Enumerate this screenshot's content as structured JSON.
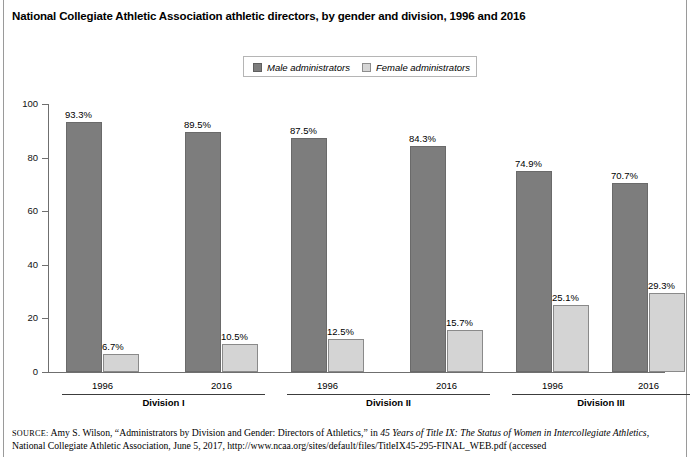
{
  "title": "National Collegiate Athletic Association athletic directors, by gender and division, 1996 and 2016",
  "legend": {
    "male": {
      "label": "Male administrators",
      "color": "#7d7d7d"
    },
    "female": {
      "label": "Female administrators",
      "color": "#d4d4d4"
    }
  },
  "axis": {
    "y_ticks": [
      "0",
      "20",
      "40",
      "60",
      "80",
      "100"
    ]
  },
  "groups": [
    {
      "label": "Division I",
      "years": [
        "1996",
        "2016"
      ]
    },
    {
      "label": "Division II",
      "years": [
        "1996",
        "2016"
      ]
    },
    {
      "label": "Division III",
      "years": [
        "1996",
        "2016"
      ]
    }
  ],
  "bars": [
    {
      "label": "93.3%",
      "value": 93.3,
      "series": "male",
      "group": "Division I",
      "year": "1996"
    },
    {
      "label": "6.7%",
      "value": 6.7,
      "series": "female",
      "group": "Division I",
      "year": "1996"
    },
    {
      "label": "89.5%",
      "value": 89.5,
      "series": "male",
      "group": "Division I",
      "year": "2016"
    },
    {
      "label": "10.5%",
      "value": 10.5,
      "series": "female",
      "group": "Division I",
      "year": "2016"
    },
    {
      "label": "87.5%",
      "value": 87.5,
      "series": "male",
      "group": "Division II",
      "year": "1996"
    },
    {
      "label": "12.5%",
      "value": 12.5,
      "series": "female",
      "group": "Division II",
      "year": "1996"
    },
    {
      "label": "84.3%",
      "value": 84.3,
      "series": "male",
      "group": "Division II",
      "year": "2016"
    },
    {
      "label": "15.7%",
      "value": 15.7,
      "series": "female",
      "group": "Division II",
      "year": "2016"
    },
    {
      "label": "74.9%",
      "value": 74.9,
      "series": "male",
      "group": "Division III",
      "year": "1996"
    },
    {
      "label": "25.1%",
      "value": 25.1,
      "series": "female",
      "group": "Division III",
      "year": "1996"
    },
    {
      "label": "70.7%",
      "value": 70.7,
      "series": "male",
      "group": "Division III",
      "year": "2016"
    },
    {
      "label": "29.3%",
      "value": 29.3,
      "series": "female",
      "group": "Division III",
      "year": "2016"
    }
  ],
  "source": {
    "prefix": "SOURCE:",
    "text_part1": " Amy S. Wilson, “Administrators by Division and Gender: Directors of Athletics,” in ",
    "italic_title": "45 Years of Title IX: The Status of Women in Intercollegiate Athletics",
    "text_part2": ", National Collegiate Athletic Association, June 5, 2017, http://www.ncaa.org/sites/default/files/TitleIX45-295-FINAL_WEB.pdf (accessed"
  },
  "chart_data": {
    "type": "bar",
    "title": "National Collegiate Athletic Association athletic directors, by gender and division, 1996 and 2016",
    "xlabel": "",
    "ylabel": "",
    "ylim": [
      0,
      100
    ],
    "yticks": [
      0,
      20,
      40,
      60,
      80,
      100
    ],
    "grid": false,
    "legend_position": "top-center",
    "categories": [
      "Division I 1996",
      "Division I 2016",
      "Division II 1996",
      "Division II 2016",
      "Division III 1996",
      "Division III 2016"
    ],
    "group_labels": [
      "Division I",
      "Division II",
      "Division III"
    ],
    "year_labels": [
      "1996",
      "2016",
      "1996",
      "2016",
      "1996",
      "2016"
    ],
    "series": [
      {
        "name": "Male administrators",
        "values": [
          93.3,
          89.5,
          87.5,
          84.3,
          74.9,
          70.7
        ],
        "color": "#7d7d7d"
      },
      {
        "name": "Female administrators",
        "values": [
          6.7,
          10.5,
          12.5,
          15.7,
          25.1,
          29.3
        ],
        "color": "#d4d4d4"
      }
    ],
    "data_labels": [
      "93.3%",
      "6.7%",
      "89.5%",
      "10.5%",
      "87.5%",
      "12.5%",
      "84.3%",
      "15.7%",
      "74.9%",
      "25.1%",
      "70.7%",
      "29.3%"
    ],
    "units": "percent"
  }
}
